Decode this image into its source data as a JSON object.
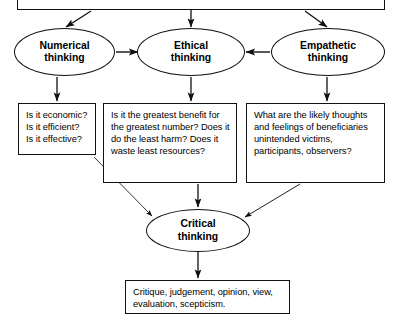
{
  "diagram": {
    "stroke_color": "#111111",
    "background_color": "#ffffff",
    "top_box": {
      "label": ""
    },
    "ellipses": [
      {
        "id": "numerical",
        "label": "Numerical\nthinking"
      },
      {
        "id": "ethical",
        "label": "Ethical\nthinking"
      },
      {
        "id": "empathetic",
        "label": "Empathetic\nthinking"
      },
      {
        "id": "critical",
        "label": "Critical\nthinking"
      }
    ],
    "boxes": [
      {
        "id": "numerical-questions",
        "label": "Is it economic?\nIs it efficient?\nIs it effective?"
      },
      {
        "id": "ethical-questions",
        "label": "Is it the greatest benefit for the greatest number? Does it do the least harm? Does it waste least resources?"
      },
      {
        "id": "empathetic-questions",
        "label": "What are the likely thoughts and feelings of beneficiaries unintended victims, participants, observers?"
      },
      {
        "id": "outcomes",
        "label": "Critique, judgement, opinion, view, evaluation, scepticism."
      }
    ],
    "arrows": [
      {
        "from": "top-box",
        "to": "numerical",
        "style": "diagonal"
      },
      {
        "from": "top-box",
        "to": "ethical",
        "style": "vertical"
      },
      {
        "from": "top-box",
        "to": "empathetic",
        "style": "diagonal"
      },
      {
        "from": "numerical",
        "to": "ethical",
        "style": "horizontal-right"
      },
      {
        "from": "empathetic",
        "to": "ethical",
        "style": "horizontal-left"
      },
      {
        "from": "numerical",
        "to": "numerical-questions",
        "style": "vertical"
      },
      {
        "from": "ethical",
        "to": "ethical-questions",
        "style": "vertical"
      },
      {
        "from": "empathetic",
        "to": "empathetic-questions",
        "style": "vertical"
      },
      {
        "from": "numerical-questions",
        "to": "critical",
        "style": "diagonal"
      },
      {
        "from": "ethical-questions",
        "to": "critical",
        "style": "vertical"
      },
      {
        "from": "empathetic-questions",
        "to": "critical",
        "style": "diagonal"
      },
      {
        "from": "critical",
        "to": "outcomes",
        "style": "vertical"
      }
    ]
  }
}
